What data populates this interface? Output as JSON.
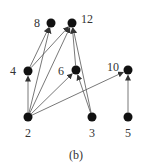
{
  "diagram": {
    "caption": "(b)",
    "nodes": [
      {
        "id": "8",
        "label": "8",
        "x": 51,
        "y": 23,
        "lx": 37,
        "ly": 27
      },
      {
        "id": "12",
        "label": "12",
        "x": 72,
        "y": 23,
        "lx": 87,
        "ly": 23
      },
      {
        "id": "4",
        "label": "4",
        "x": 28,
        "y": 71,
        "lx": 13,
        "ly": 75
      },
      {
        "id": "6",
        "label": "6",
        "x": 76,
        "y": 70,
        "lx": 61,
        "ly": 75
      },
      {
        "id": "10",
        "label": "10",
        "x": 128,
        "y": 70,
        "lx": 113,
        "ly": 71
      },
      {
        "id": "2",
        "label": "2",
        "x": 28,
        "y": 117,
        "lx": 28,
        "ly": 137
      },
      {
        "id": "3",
        "label": "3",
        "x": 92,
        "y": 117,
        "lx": 92,
        "ly": 137
      },
      {
        "id": "5",
        "label": "5",
        "x": 128,
        "y": 117,
        "lx": 128,
        "ly": 137
      }
    ],
    "edges": [
      {
        "from": "2",
        "to": "4"
      },
      {
        "from": "2",
        "to": "8"
      },
      {
        "from": "2",
        "to": "12"
      },
      {
        "from": "2",
        "to": "6"
      },
      {
        "from": "2",
        "to": "10"
      },
      {
        "from": "4",
        "to": "8"
      },
      {
        "from": "4",
        "to": "12"
      },
      {
        "from": "3",
        "to": "6"
      },
      {
        "from": "3",
        "to": "12"
      },
      {
        "from": "6",
        "to": "12"
      },
      {
        "from": "5",
        "to": "10"
      }
    ],
    "colors": {
      "node": "#111111",
      "edge": "#555555",
      "label": "#333333"
    }
  }
}
